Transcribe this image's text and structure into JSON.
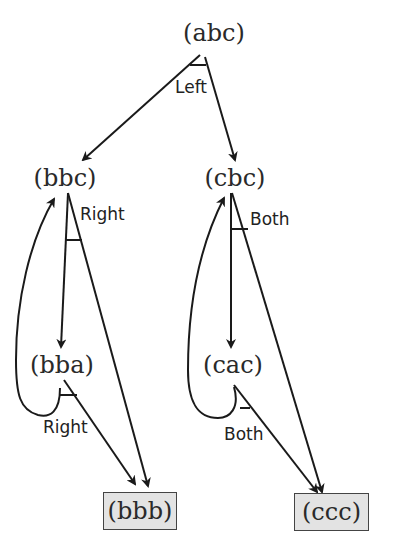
{
  "nodes": {
    "abc": "(abc)",
    "bbc": "(bbc)",
    "cbc": "(cbc)",
    "bba": "(bba)",
    "cac": "(cac)",
    "bbb": "(bbb)",
    "ccc": "(ccc)"
  },
  "edge_labels": {
    "abc_split": "Left",
    "bbc_split": "Right",
    "cbc_split": "Both",
    "bba_split": "Right",
    "cac_split": "Both"
  },
  "terminal_nodes": [
    "(bbb)",
    "(ccc)"
  ],
  "colors": {
    "line": "#1a1a1a",
    "terminal_fill": "#e3e3e3"
  }
}
